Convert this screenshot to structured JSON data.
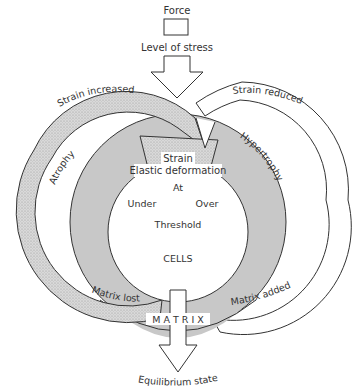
{
  "diagram": {
    "top": {
      "force_label": "Force",
      "stress_label": "Level of stress"
    },
    "outer_loops": {
      "left_loop_label": "Strain increased",
      "right_loop_label": "Strain reduced",
      "left_inner_label": "Atrophy",
      "right_inner_label": "Hypertrophy",
      "left_bottom_label": "Matrix lost",
      "right_bottom_label": "Matrix added"
    },
    "center": {
      "strain_label": "Strain",
      "elastic_label": "Elastic deformation",
      "at_label": "At",
      "under_label": "Under",
      "over_label": "Over",
      "threshold_label": "Threshold",
      "cells_label": "CELLS"
    },
    "bottom": {
      "matrix_label": "M A T R I X",
      "equilibrium_label": "Equilibrium state"
    },
    "colors": {
      "matrix_ring": "#c8c8c8",
      "stipple_loop": "#d6d6d6",
      "stroke": "#333333",
      "background": "#ffffff"
    }
  }
}
